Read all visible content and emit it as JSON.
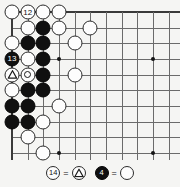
{
  "diagram": {
    "type": "go-board-problem-diagram",
    "board": {
      "cols": 11,
      "rows": 10,
      "origin_x": 12,
      "origin_y": 12,
      "spacing": 15.66,
      "edges": {
        "top": true,
        "left": true,
        "right": false,
        "bottom": false
      },
      "line_color": "#6b6b6b",
      "edge_color": "#3a3a3a",
      "background": "#f5f5f3",
      "star_points": [
        {
          "col": 3,
          "row": 3
        },
        {
          "col": 9,
          "row": 3
        },
        {
          "col": 3,
          "row": 9
        },
        {
          "col": 9,
          "row": 9
        }
      ]
    },
    "stones": [
      {
        "col": 0,
        "row": 0,
        "color": "white",
        "label": "",
        "mark": ""
      },
      {
        "col": 1,
        "row": 0,
        "color": "white",
        "label": "12",
        "mark": ""
      },
      {
        "col": 2,
        "row": 0,
        "color": "white",
        "label": "",
        "mark": ""
      },
      {
        "col": 3,
        "row": 0,
        "color": "white",
        "label": "",
        "mark": ""
      },
      {
        "col": 1,
        "row": 1,
        "color": "white",
        "label": "",
        "mark": ""
      },
      {
        "col": 2,
        "row": 1,
        "color": "black",
        "label": "",
        "mark": ""
      },
      {
        "col": 3,
        "row": 1,
        "color": "white",
        "label": "",
        "mark": ""
      },
      {
        "col": 5,
        "row": 1,
        "color": "white",
        "label": "",
        "mark": ""
      },
      {
        "col": 0,
        "row": 2,
        "color": "white",
        "label": "",
        "mark": ""
      },
      {
        "col": 1,
        "row": 2,
        "color": "black",
        "label": "",
        "mark": ""
      },
      {
        "col": 2,
        "row": 2,
        "color": "black",
        "label": "",
        "mark": ""
      },
      {
        "col": 4,
        "row": 2,
        "color": "white",
        "label": "",
        "mark": ""
      },
      {
        "col": 0,
        "row": 3,
        "color": "black",
        "label": "13",
        "mark": ""
      },
      {
        "col": 1,
        "row": 3,
        "color": "white",
        "label": "",
        "mark": ""
      },
      {
        "col": 2,
        "row": 3,
        "color": "black",
        "label": "",
        "mark": ""
      },
      {
        "col": 0,
        "row": 4,
        "color": "white",
        "label": "",
        "mark": "triangle"
      },
      {
        "col": 1,
        "row": 4,
        "color": "white",
        "label": "",
        "mark": "circle"
      },
      {
        "col": 2,
        "row": 4,
        "color": "black",
        "label": "",
        "mark": ""
      },
      {
        "col": 4,
        "row": 4,
        "color": "white",
        "label": "",
        "mark": ""
      },
      {
        "col": 0,
        "row": 5,
        "color": "white",
        "label": "",
        "mark": ""
      },
      {
        "col": 1,
        "row": 5,
        "color": "black",
        "label": "",
        "mark": ""
      },
      {
        "col": 2,
        "row": 5,
        "color": "black",
        "label": "",
        "mark": ""
      },
      {
        "col": 0,
        "row": 6,
        "color": "black",
        "label": "",
        "mark": ""
      },
      {
        "col": 1,
        "row": 6,
        "color": "black",
        "label": "",
        "mark": ""
      },
      {
        "col": 3,
        "row": 6,
        "color": "white",
        "label": "",
        "mark": ""
      },
      {
        "col": 0,
        "row": 7,
        "color": "black",
        "label": "",
        "mark": ""
      },
      {
        "col": 1,
        "row": 7,
        "color": "black",
        "label": "",
        "mark": ""
      },
      {
        "col": 2,
        "row": 7,
        "color": "white",
        "label": "",
        "mark": ""
      },
      {
        "col": 1,
        "row": 8,
        "color": "white",
        "label": "",
        "mark": ""
      },
      {
        "col": 2,
        "row": 9,
        "color": "white",
        "label": "",
        "mark": ""
      }
    ]
  },
  "legend": {
    "items": [
      {
        "move_stone": {
          "color": "white",
          "label": "14"
        },
        "equals": "=",
        "ref_stone": {
          "color": "white",
          "label": "",
          "mark": "triangle"
        }
      },
      {
        "move_stone": {
          "color": "black",
          "label": "4"
        },
        "equals": "=",
        "ref_stone": {
          "color": "white",
          "label": "",
          "mark": ""
        }
      }
    ]
  }
}
